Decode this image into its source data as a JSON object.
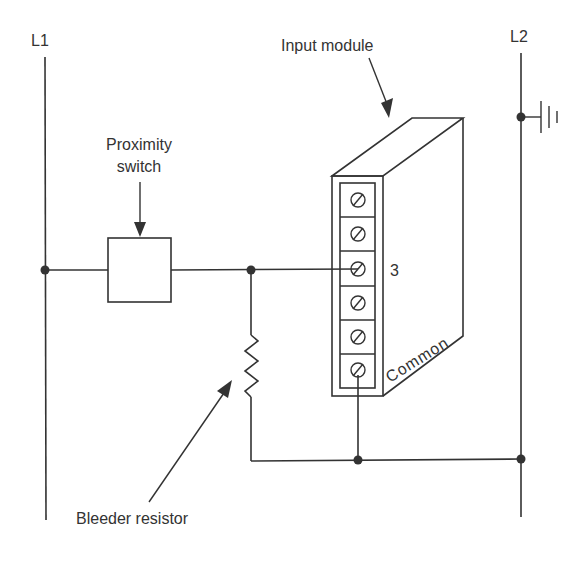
{
  "diagram": {
    "rails": {
      "left": {
        "label": "L1"
      },
      "right": {
        "label": "L2"
      }
    },
    "labels": {
      "input_module": "Input module",
      "proximity_line1": "Proximity",
      "proximity_line2": "switch",
      "terminal_number": "3",
      "common": "Common",
      "bleeder_resistor": "Bleeder resistor"
    },
    "module": {
      "terminal_count": 6,
      "connected_input_terminal": 3,
      "common_terminal": 6
    },
    "components": [
      "L1 rail",
      "L2 rail",
      "Proximity switch",
      "Bleeder resistor",
      "Input module",
      "Ground"
    ],
    "colors": {
      "line": "#333333",
      "background": "#ffffff"
    }
  }
}
